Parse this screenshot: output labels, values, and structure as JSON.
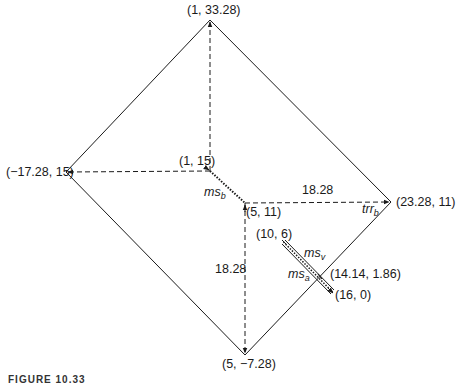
{
  "diagram": {
    "points": {
      "top": {
        "label": "(1, 33.28)",
        "x": 1,
        "y": 33.28
      },
      "left": {
        "label": "(−17.28, 15)",
        "x": -17.28,
        "y": 15
      },
      "inner_upper": {
        "label": "(1, 15)",
        "x": 1,
        "y": 15
      },
      "center": {
        "label": "(5, 11)",
        "x": 5,
        "y": 11
      },
      "right": {
        "label": "(23.28, 11)",
        "x": 23.28,
        "y": 11
      },
      "bottom": {
        "label": "(5, −7.28)",
        "x": 5,
        "y": -7.28
      },
      "bar_start": {
        "label": "(10, 6)",
        "x": 10,
        "y": 6
      },
      "bar_cross": {
        "label": "(14.14, 1.86)",
        "x": 14.14,
        "y": 1.86
      },
      "bar_end": {
        "label": "(16, 0)",
        "x": 16,
        "y": 0
      }
    },
    "dimensions": {
      "horizontal": "18.28",
      "vertical": "18.28"
    },
    "symbols": {
      "ms_b": {
        "base": "ms",
        "sub": "b"
      },
      "trr_b": {
        "base": "trr",
        "sub": "b"
      },
      "ms_v": {
        "base": "ms",
        "sub": "v"
      },
      "ms_a": {
        "base": "ms",
        "sub": "a"
      }
    },
    "caption": "FIGURE 10.33",
    "colors": {
      "line": "#1a1a1a",
      "background": "#ffffff"
    }
  }
}
